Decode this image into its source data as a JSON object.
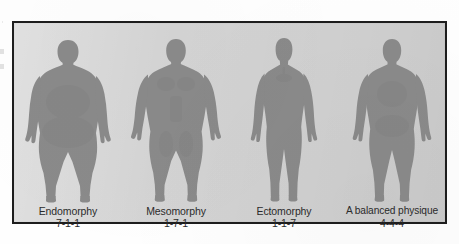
{
  "figure": {
    "panel_background_color": "#d4d4d4",
    "border_color": "#1d1d1d",
    "silhouette_color": "#8a8a8a",
    "text_color": "#2b2b2b",
    "somatotypes": [
      {
        "name": "Endomorphy",
        "rating": "7-1-1",
        "body_shape": "round, heavy, wide waist and hips"
      },
      {
        "name": "Mesomorphy",
        "rating": "1-7-1",
        "body_shape": "muscular, broad shoulders, V-taper"
      },
      {
        "name": "Ectomorphy",
        "rating": "1-1-7",
        "body_shape": "tall, slender, narrow frame, long limbs"
      },
      {
        "name": "A balanced physique",
        "rating": "4-4-4",
        "body_shape": "moderate, average proportions"
      }
    ]
  }
}
